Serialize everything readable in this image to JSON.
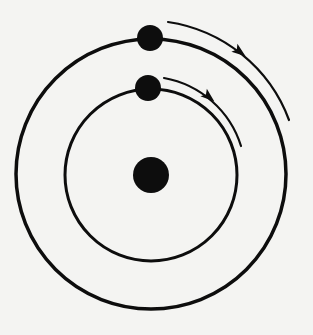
{
  "colors": {
    "background": "#f4f4f2",
    "ink": "#0d0d0d"
  },
  "center_body": {
    "cx": 151,
    "cy": 175,
    "r": 18
  },
  "orbits": [
    {
      "name": "inner-orbit",
      "cx": 151,
      "cy": 175,
      "r": 86,
      "stroke_width": 3
    },
    {
      "name": "outer-orbit",
      "cx": 151,
      "cy": 174,
      "r": 135,
      "stroke_width": 3.5
    }
  ],
  "satellites": [
    {
      "name": "outer-satellite",
      "cx": 150,
      "cy": 38,
      "r": 13
    },
    {
      "name": "inner-satellite",
      "cx": 148,
      "cy": 88,
      "r": 13
    }
  ],
  "arrows": [
    {
      "name": "outer-orbit-direction-arrow",
      "d": "M 168 22 A 153 153 0 0 1 289 120",
      "head": {
        "x": 240,
        "y": 52,
        "angle": 37
      }
    },
    {
      "name": "inner-orbit-direction-arrow",
      "d": "M 164 78 A 99 99 0 0 1 241 146",
      "head": {
        "x": 209,
        "y": 97,
        "angle": 40
      }
    }
  ]
}
